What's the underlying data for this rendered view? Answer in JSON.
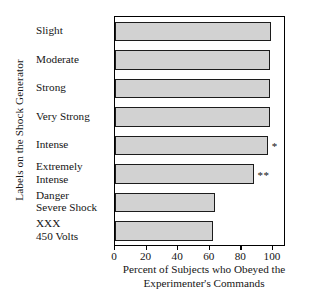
{
  "chart_data": {
    "type": "bar",
    "orientation": "horizontal",
    "title": "",
    "xlabel_line1": "Percent of Subjects who Obeyed the",
    "xlabel_line2": "Experimenter's Commands",
    "ylabel": "Labels on the Shock Generator",
    "xlim": [
      0,
      107
    ],
    "xticks": [
      0,
      20,
      40,
      60,
      80,
      100
    ],
    "xticklabels": [
      "0",
      "20",
      "40",
      "60",
      "80",
      "100"
    ],
    "grid": false,
    "legend": null,
    "bar_color": "#d2d2d2",
    "bar_edge_color": "#1c1c1c",
    "categories": [
      "Slight",
      "Moderate",
      "Strong",
      "Very Strong",
      "Intense",
      "Extremely Intense",
      "Danger Severe Shock",
      "XXX 450 Volts"
    ],
    "category_lines": [
      [
        "Slight",
        ""
      ],
      [
        "Moderate",
        ""
      ],
      [
        "Strong",
        ""
      ],
      [
        "Very Strong",
        ""
      ],
      [
        "Intense",
        ""
      ],
      [
        "Extremely",
        "Intense"
      ],
      [
        "Danger",
        "Severe Shock"
      ],
      [
        "XXX",
        "450 Volts"
      ]
    ],
    "values": [
      99,
      98,
      98,
      98,
      97,
      88,
      63,
      62
    ],
    "annotations": [
      {
        "category": "Intense",
        "symbol": "*"
      },
      {
        "category": "Extremely Intense",
        "symbol": "**"
      }
    ]
  }
}
